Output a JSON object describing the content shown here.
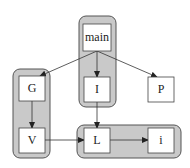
{
  "diagram": {
    "type": "directed-graph",
    "colors": {
      "cluster_fill": "#c9c9c9",
      "cluster_stroke": "#555555",
      "node_fill": "#ffffff",
      "node_stroke": "#444444",
      "edge": "#333333"
    },
    "clusters": [
      {
        "id": "cluster-main",
        "members": [
          "main",
          "I"
        ]
      },
      {
        "id": "cluster-gv",
        "members": [
          "G",
          "V"
        ]
      },
      {
        "id": "cluster-li",
        "members": [
          "L",
          "i"
        ]
      }
    ],
    "nodes": [
      {
        "id": "main",
        "label": "main"
      },
      {
        "id": "G",
        "label": "G"
      },
      {
        "id": "I",
        "label": "I"
      },
      {
        "id": "P",
        "label": "P"
      },
      {
        "id": "V",
        "label": "V"
      },
      {
        "id": "L",
        "label": "L"
      },
      {
        "id": "i",
        "label": "i"
      }
    ],
    "edges": [
      {
        "from": "main",
        "to": "G"
      },
      {
        "from": "main",
        "to": "I"
      },
      {
        "from": "main",
        "to": "P"
      },
      {
        "from": "G",
        "to": "V"
      },
      {
        "from": "I",
        "to": "L"
      },
      {
        "from": "V",
        "to": "L"
      },
      {
        "from": "L",
        "to": "i"
      }
    ]
  },
  "labels": {
    "main": "main",
    "G": "G",
    "I": "I",
    "P": "P",
    "V": "V",
    "L": "L",
    "i": "i"
  }
}
